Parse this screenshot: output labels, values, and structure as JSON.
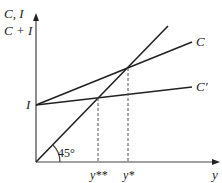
{
  "diagram": {
    "type": "keynesian-cross",
    "y_axis_label_line1": "C, I",
    "y_axis_label_line2": "C + I",
    "x_axis_label": "y",
    "intercept_label": "I",
    "angle_label": "45°",
    "curves": [
      {
        "name": "45-degree line",
        "label": ""
      },
      {
        "name": "consumption-plus-investment",
        "label": "C"
      },
      {
        "name": "reduced-consumption-plus-investment",
        "label": "C′"
      }
    ],
    "equilibria": [
      {
        "label": "y**",
        "on_curve": "C′"
      },
      {
        "label": "y*",
        "on_curve": "C"
      }
    ]
  }
}
